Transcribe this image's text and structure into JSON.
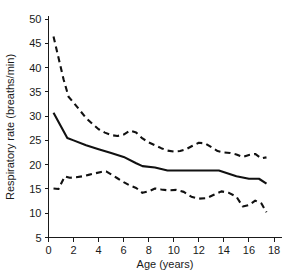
{
  "chart_data": {
    "type": "line",
    "title": "",
    "xlabel": "Age (years)",
    "ylabel": "Respiratory rate (breaths/min)",
    "xlim": [
      0,
      19
    ],
    "ylim": [
      5,
      52
    ],
    "xticks": [
      0,
      2,
      4,
      6,
      8,
      10,
      12,
      14,
      16,
      18
    ],
    "yticks": [
      5,
      10,
      15,
      20,
      25,
      30,
      35,
      40,
      45,
      50
    ],
    "xtick_labels": [
      "0",
      "2",
      "4",
      "6",
      "8",
      "10",
      "12",
      "14",
      "16",
      "18"
    ],
    "ytick_labels": [
      "5",
      "10",
      "15",
      "20",
      "25",
      "30",
      "35",
      "40",
      "45",
      "50"
    ],
    "grid": false,
    "legend": "none",
    "line_color": "#111111",
    "series": [
      {
        "name": "Upper centile",
        "style": "dashed",
        "x": [
          0.4,
          0.8,
          1.2,
          1.6,
          2.0,
          2.5,
          3.0,
          3.5,
          4.0,
          4.5,
          5.0,
          5.5,
          6.0,
          6.5,
          7.0,
          7.5,
          8.0,
          8.5,
          9.0,
          9.5,
          10.0,
          10.5,
          11.0,
          11.5,
          12.0,
          12.5,
          13.0,
          13.5,
          14.0,
          14.5,
          15.0,
          15.5,
          16.0,
          16.5,
          17.0,
          17.4
        ],
        "values": [
          46.4,
          42.0,
          37.6,
          34.0,
          32.8,
          31.2,
          29.6,
          28.4,
          27.3,
          26.6,
          26.1,
          25.9,
          26.2,
          27.0,
          26.6,
          25.4,
          24.6,
          24.0,
          23.4,
          22.9,
          22.7,
          22.8,
          23.2,
          23.9,
          24.5,
          24.4,
          23.6,
          22.8,
          22.5,
          22.4,
          22.1,
          21.6,
          22.0,
          22.2,
          21.3,
          21.5
        ]
      },
      {
        "name": "Median",
        "style": "solid",
        "x": [
          0.4,
          1.5,
          2.0,
          3.0,
          4.0,
          5.0,
          6.0,
          7.0,
          7.5,
          8.5,
          9.5,
          11.0,
          12.0,
          13.0,
          13.6,
          15.0,
          16.0,
          16.8,
          17.4
        ],
        "values": [
          30.7,
          25.5,
          25.0,
          24.0,
          23.2,
          22.4,
          21.6,
          20.3,
          19.7,
          19.4,
          18.8,
          18.8,
          18.8,
          18.8,
          18.8,
          17.6,
          17.1,
          17.1,
          16.1
        ]
      },
      {
        "name": "Lower centile",
        "style": "dashed",
        "x": [
          0.4,
          0.8,
          1.3,
          1.7,
          2.2,
          2.7,
          3.2,
          3.7,
          4.2,
          4.6,
          5.0,
          5.5,
          6.0,
          6.5,
          7.0,
          7.5,
          8.0,
          8.5,
          9.0,
          9.6,
          10.2,
          10.8,
          11.4,
          12.0,
          12.6,
          13.2,
          13.8,
          14.4,
          15.0,
          15.5,
          16.0,
          16.5,
          17.0,
          17.4
        ],
        "values": [
          15.1,
          15.0,
          17.6,
          17.3,
          17.4,
          17.6,
          17.9,
          18.2,
          18.5,
          18.6,
          18.0,
          17.2,
          16.4,
          15.7,
          15.2,
          14.2,
          14.5,
          15.1,
          14.9,
          14.7,
          14.8,
          14.4,
          13.4,
          13.0,
          13.1,
          13.8,
          14.5,
          14.2,
          13.4,
          11.4,
          11.7,
          12.6,
          12.0,
          10.2
        ]
      }
    ]
  }
}
